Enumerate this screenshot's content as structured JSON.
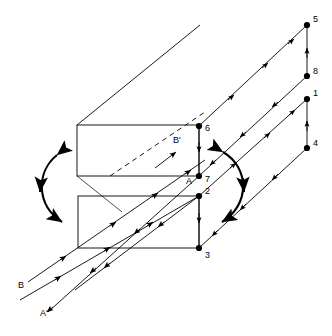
{
  "figure": {
    "type": "technical-line-diagram",
    "background_color": "#ffffff",
    "line_color": "#000000",
    "node_color": "#000000",
    "width": 332,
    "height": 336
  },
  "nodes": [
    {
      "id": "5",
      "label": "5",
      "x": 307,
      "y": 25,
      "label_x": 313,
      "label_y": 22
    },
    {
      "id": "8",
      "label": "8",
      "x": 307,
      "y": 76,
      "label_x": 313,
      "label_y": 74
    },
    {
      "id": "1",
      "label": "1",
      "x": 307,
      "y": 99,
      "label_x": 313,
      "label_y": 96
    },
    {
      "id": "4",
      "label": "4",
      "x": 307,
      "y": 148,
      "label_x": 313,
      "label_y": 146
    },
    {
      "id": "6",
      "label": "6",
      "x": 199,
      "y": 126,
      "label_x": 205,
      "label_y": 131
    },
    {
      "id": "7",
      "label": "7",
      "x": 199,
      "y": 176,
      "label_x": 205,
      "label_y": 182
    },
    {
      "id": "2",
      "label": "2",
      "x": 199,
      "y": 196,
      "label_x": 205,
      "label_y": 194
    },
    {
      "id": "3",
      "label": "3",
      "x": 199,
      "y": 248,
      "label_x": 205,
      "label_y": 258
    }
  ],
  "axis_labels": [
    {
      "id": "A",
      "label": "A",
      "x": 186,
      "y": 184
    },
    {
      "id": "A-prime",
      "label": "A'",
      "x": 40,
      "y": 316
    },
    {
      "id": "B",
      "label": "B",
      "x": 18,
      "y": 288
    },
    {
      "id": "B-prime",
      "label": "B'",
      "x": 173,
      "y": 143
    }
  ],
  "boxes": [
    {
      "id": "upper-slab",
      "x": 77,
      "y": 125,
      "w": 122,
      "h": 51
    },
    {
      "id": "lower-slab",
      "x": 78,
      "y": 196,
      "w": 121,
      "h": 52
    }
  ],
  "rotation_arrows": [
    {
      "id": "left-rotation-arrow",
      "direction": "double-headed",
      "bow": "left"
    },
    {
      "id": "right-rotation-arrow",
      "direction": "double-headed",
      "bow": "right"
    }
  ],
  "legend_notes": {
    "vertical_edges": "arrowheads on segments 8-5, 4-1, 6-7, 2-3",
    "diagonal_rays": "parallel arrowed rays along the A/A' and B/B' directions",
    "dashed_line": "hidden edge inside upper slab along B' direction"
  }
}
